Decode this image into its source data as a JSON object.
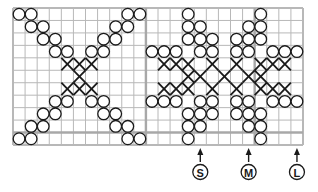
{
  "grid": {
    "cols": 24,
    "rows": 11,
    "section_divider_cols": [
      11,
      20
    ],
    "section_divider_rows": [
      10
    ]
  },
  "colors": {
    "grid_line": "#b8b8b8",
    "divider_line": "#a8a8a8",
    "symbol": "#1a1a1a",
    "background": "#ffffff"
  },
  "legend_symbols": {
    "O": "circle-stitch",
    "X": "cross-stitch"
  },
  "cells": [
    {
      "r": 0,
      "c": 0,
      "s": "O"
    },
    {
      "r": 0,
      "c": 1,
      "s": "O"
    },
    {
      "r": 0,
      "c": 9,
      "s": "O"
    },
    {
      "r": 0,
      "c": 10,
      "s": "O"
    },
    {
      "r": 1,
      "c": 1,
      "s": "O"
    },
    {
      "r": 1,
      "c": 2,
      "s": "O"
    },
    {
      "r": 1,
      "c": 8,
      "s": "O"
    },
    {
      "r": 1,
      "c": 9,
      "s": "O"
    },
    {
      "r": 2,
      "c": 2,
      "s": "O"
    },
    {
      "r": 2,
      "c": 3,
      "s": "O"
    },
    {
      "r": 2,
      "c": 7,
      "s": "O"
    },
    {
      "r": 2,
      "c": 8,
      "s": "O"
    },
    {
      "r": 3,
      "c": 3,
      "s": "O"
    },
    {
      "r": 3,
      "c": 4,
      "s": "O"
    },
    {
      "r": 3,
      "c": 6,
      "s": "O"
    },
    {
      "r": 3,
      "c": 7,
      "s": "O"
    },
    {
      "r": 4,
      "c": 4,
      "s": "X"
    },
    {
      "r": 4,
      "c": 5,
      "s": "X"
    },
    {
      "r": 4,
      "c": 6,
      "s": "X"
    },
    {
      "r": 5,
      "c": 5,
      "s": "X"
    },
    {
      "r": 6,
      "c": 4,
      "s": "X"
    },
    {
      "r": 6,
      "c": 5,
      "s": "X"
    },
    {
      "r": 6,
      "c": 6,
      "s": "X"
    },
    {
      "r": 7,
      "c": 3,
      "s": "O"
    },
    {
      "r": 7,
      "c": 4,
      "s": "O"
    },
    {
      "r": 7,
      "c": 6,
      "s": "O"
    },
    {
      "r": 7,
      "c": 7,
      "s": "O"
    },
    {
      "r": 8,
      "c": 2,
      "s": "O"
    },
    {
      "r": 8,
      "c": 3,
      "s": "O"
    },
    {
      "r": 8,
      "c": 7,
      "s": "O"
    },
    {
      "r": 8,
      "c": 8,
      "s": "O"
    },
    {
      "r": 9,
      "c": 1,
      "s": "O"
    },
    {
      "r": 9,
      "c": 2,
      "s": "O"
    },
    {
      "r": 9,
      "c": 8,
      "s": "O"
    },
    {
      "r": 9,
      "c": 9,
      "s": "O"
    },
    {
      "r": 10,
      "c": 0,
      "s": "O"
    },
    {
      "r": 10,
      "c": 1,
      "s": "O"
    },
    {
      "r": 10,
      "c": 9,
      "s": "O"
    },
    {
      "r": 10,
      "c": 10,
      "s": "O"
    },
    {
      "r": 0,
      "c": 14,
      "s": "O"
    },
    {
      "r": 0,
      "c": 20,
      "s": "O"
    },
    {
      "r": 1,
      "c": 14,
      "s": "O"
    },
    {
      "r": 1,
      "c": 15,
      "s": "O"
    },
    {
      "r": 1,
      "c": 19,
      "s": "O"
    },
    {
      "r": 1,
      "c": 20,
      "s": "O"
    },
    {
      "r": 2,
      "c": 14,
      "s": "O"
    },
    {
      "r": 2,
      "c": 15,
      "s": "O"
    },
    {
      "r": 2,
      "c": 16,
      "s": "O"
    },
    {
      "r": 2,
      "c": 18,
      "s": "O"
    },
    {
      "r": 2,
      "c": 19,
      "s": "O"
    },
    {
      "r": 2,
      "c": 20,
      "s": "O"
    },
    {
      "r": 3,
      "c": 11,
      "s": "O"
    },
    {
      "r": 3,
      "c": 12,
      "s": "O"
    },
    {
      "r": 3,
      "c": 13,
      "s": "O"
    },
    {
      "r": 3,
      "c": 15,
      "s": "O"
    },
    {
      "r": 3,
      "c": 16,
      "s": "O"
    },
    {
      "r": 3,
      "c": 18,
      "s": "O"
    },
    {
      "r": 3,
      "c": 19,
      "s": "O"
    },
    {
      "r": 3,
      "c": 21,
      "s": "O"
    },
    {
      "r": 3,
      "c": 22,
      "s": "O"
    },
    {
      "r": 3,
      "c": 23,
      "s": "O"
    },
    {
      "r": 4,
      "c": 12,
      "s": "X"
    },
    {
      "r": 4,
      "c": 13,
      "s": "X"
    },
    {
      "r": 4,
      "c": 14,
      "s": "X"
    },
    {
      "r": 4,
      "c": 16,
      "s": "X"
    },
    {
      "r": 4,
      "c": 18,
      "s": "X"
    },
    {
      "r": 4,
      "c": 20,
      "s": "X"
    },
    {
      "r": 4,
      "c": 21,
      "s": "X"
    },
    {
      "r": 4,
      "c": 22,
      "s": "X"
    },
    {
      "r": 5,
      "c": 14,
      "s": "X"
    },
    {
      "r": 5,
      "c": 15,
      "s": "X"
    },
    {
      "r": 5,
      "c": 17,
      "s": "X"
    },
    {
      "r": 5,
      "c": 19,
      "s": "X"
    },
    {
      "r": 5,
      "c": 20,
      "s": "X"
    },
    {
      "r": 6,
      "c": 12,
      "s": "X"
    },
    {
      "r": 6,
      "c": 13,
      "s": "X"
    },
    {
      "r": 6,
      "c": 14,
      "s": "X"
    },
    {
      "r": 6,
      "c": 16,
      "s": "X"
    },
    {
      "r": 6,
      "c": 18,
      "s": "X"
    },
    {
      "r": 6,
      "c": 20,
      "s": "X"
    },
    {
      "r": 6,
      "c": 21,
      "s": "X"
    },
    {
      "r": 6,
      "c": 22,
      "s": "X"
    },
    {
      "r": 7,
      "c": 11,
      "s": "O"
    },
    {
      "r": 7,
      "c": 12,
      "s": "O"
    },
    {
      "r": 7,
      "c": 13,
      "s": "O"
    },
    {
      "r": 7,
      "c": 15,
      "s": "O"
    },
    {
      "r": 7,
      "c": 16,
      "s": "O"
    },
    {
      "r": 7,
      "c": 18,
      "s": "O"
    },
    {
      "r": 7,
      "c": 19,
      "s": "O"
    },
    {
      "r": 7,
      "c": 21,
      "s": "O"
    },
    {
      "r": 7,
      "c": 22,
      "s": "O"
    },
    {
      "r": 7,
      "c": 23,
      "s": "O"
    },
    {
      "r": 8,
      "c": 14,
      "s": "O"
    },
    {
      "r": 8,
      "c": 15,
      "s": "O"
    },
    {
      "r": 8,
      "c": 16,
      "s": "O"
    },
    {
      "r": 8,
      "c": 18,
      "s": "O"
    },
    {
      "r": 8,
      "c": 19,
      "s": "O"
    },
    {
      "r": 8,
      "c": 20,
      "s": "O"
    },
    {
      "r": 9,
      "c": 14,
      "s": "O"
    },
    {
      "r": 9,
      "c": 15,
      "s": "O"
    },
    {
      "r": 9,
      "c": 19,
      "s": "O"
    },
    {
      "r": 9,
      "c": 20,
      "s": "O"
    },
    {
      "r": 10,
      "c": 14,
      "s": "O"
    },
    {
      "r": 10,
      "c": 20,
      "s": "O"
    }
  ],
  "size_markers": [
    {
      "label": "S",
      "col": 15
    },
    {
      "label": "M",
      "col": 19
    },
    {
      "label": "L",
      "col": 23
    }
  ]
}
